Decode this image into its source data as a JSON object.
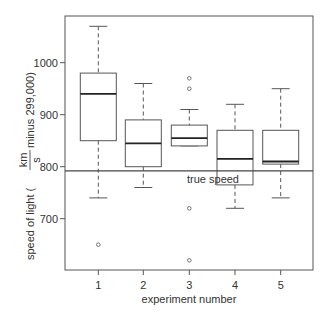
{
  "chart_data": {
    "type": "box",
    "title": "",
    "xlabel": "experiment number",
    "ylabel_parts": [
      "speed of light (",
      "km",
      "s",
      " minus 299,000)"
    ],
    "categories": [
      "1",
      "2",
      "3",
      "4",
      "5"
    ],
    "yticks": [
      700,
      800,
      900,
      1000
    ],
    "ylim": [
      600,
      1090
    ],
    "boxes": [
      {
        "name": "1",
        "whisker_low": 740,
        "q1": 850,
        "median": 940,
        "q3": 980,
        "whisker_high": 1070,
        "outliers": [
          650
        ]
      },
      {
        "name": "2",
        "whisker_low": 760,
        "q1": 800,
        "median": 845,
        "q3": 890,
        "whisker_high": 960,
        "outliers": []
      },
      {
        "name": "3",
        "whisker_low": 840,
        "q1": 840,
        "median": 855,
        "q3": 880,
        "whisker_high": 910,
        "outliers": [
          970,
          950,
          720,
          620
        ]
      },
      {
        "name": "4",
        "whisker_low": 720,
        "q1": 765,
        "median": 815,
        "q3": 870,
        "whisker_high": 920,
        "outliers": []
      },
      {
        "name": "5",
        "whisker_low": 740,
        "q1": 805,
        "median": 810,
        "q3": 870,
        "whisker_high": 950,
        "outliers": []
      }
    ],
    "reference_line": {
      "value": 792,
      "label": "true speed"
    },
    "grid": false,
    "legend": null
  }
}
